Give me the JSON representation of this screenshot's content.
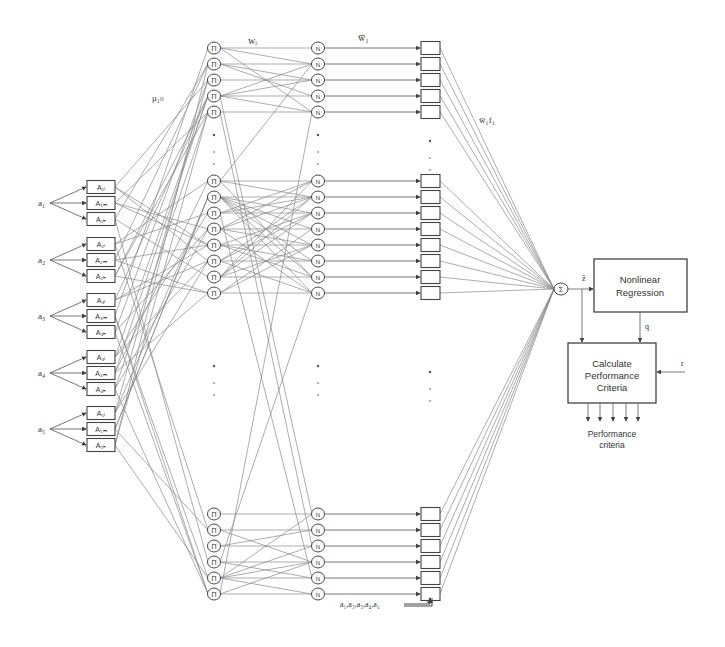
{
  "inputs": [
    {
      "label": "a₁",
      "sub": "1",
      "y": 203,
      "mf": [
        "A₁ₗ",
        "A₁ₘ",
        "A₁ₕ"
      ],
      "mf_labels": [
        "A1L",
        "A1M",
        "A1H"
      ]
    },
    {
      "label": "a₂",
      "sub": "2",
      "y": 260,
      "mf": [
        "A₂ₗ",
        "A₂ₘ",
        "A₂ₕ"
      ],
      "mf_labels": [
        "A2L",
        "A2M",
        "A2H"
      ]
    },
    {
      "label": "a₃",
      "sub": "3",
      "y": 316,
      "mf": [
        "A₃ₗ",
        "A₃ₘ",
        "A₃ₕ"
      ],
      "mf_labels": [
        "A3L",
        "A3M",
        "A3H"
      ]
    },
    {
      "label": "a₄",
      "sub": "4",
      "y": 373,
      "mf": [
        "A₄ₗ",
        "A₄ₘ",
        "A₄ₕ"
      ],
      "mf_labels": [
        "A4L",
        "A4M",
        "A4H"
      ]
    },
    {
      "label": "a₅",
      "sub": "5",
      "y": 429,
      "mf": [
        "A₅ₗ",
        "A₅ₘ",
        "A₅ₕ"
      ],
      "mf_labels": [
        "A5L",
        "A5M",
        "A5H"
      ]
    }
  ],
  "layers": {
    "product_symbol": "Π",
    "normalize_symbol": "N",
    "sum_symbol": "Σ",
    "groups": [
      {
        "ys": [
          48,
          64,
          80,
          96,
          112
        ]
      },
      {
        "ys": [
          181,
          197,
          213,
          229,
          245,
          261,
          277,
          293
        ]
      },
      {
        "ys": [
          514,
          530,
          546,
          562,
          578,
          594
        ]
      }
    ],
    "ellipsis_ys": [
      [
        135,
        152,
        164
      ],
      [
        366,
        383,
        395
      ]
    ]
  },
  "labels": {
    "mu": "μ₁ₗₗ",
    "mu_text": "μA1L",
    "w": "wᵢ",
    "w_text": "w1",
    "w_bar": "w̅₁",
    "w_bar_text": "w1 (normalized)",
    "w_bar_f": "w̅₁f₁",
    "w_bar_f_text": "w1 f1",
    "z_hat": "ẑ",
    "q": "q",
    "r": "r",
    "consequent_inputs": "a₁,a₂,a₃,a₄,a₅"
  },
  "blocks": {
    "regression": {
      "line1": "Nonlinear",
      "line2": "Regression"
    },
    "performance": {
      "line1": "Calculate",
      "line2": "Performance",
      "line3": "Criteria"
    },
    "output_label": {
      "line1": "Performance",
      "line2": "criteria"
    }
  },
  "colors": {
    "edge": "#8a8a8a",
    "stroke": "#444444",
    "background": "#ffffff"
  }
}
